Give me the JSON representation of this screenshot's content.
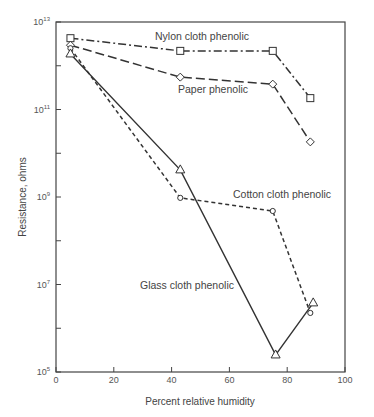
{
  "chart_data": {
    "type": "line",
    "title": "",
    "xlabel": "Percent relative humidity",
    "ylabel": "Resistance, ohms",
    "xlim": [
      0,
      100
    ],
    "ylim_log10": [
      5,
      13
    ],
    "y_scale": "log",
    "x_ticks": [
      "0",
      "20",
      "40",
      "60",
      "80",
      "100"
    ],
    "y_ticks": [
      {
        "base": "10",
        "exp": "13",
        "log": 13
      },
      {
        "base": "10",
        "exp": "11",
        "log": 11
      },
      {
        "base": "10",
        "exp": "9",
        "log": 9
      },
      {
        "base": "10",
        "exp": "7",
        "log": 7
      },
      {
        "base": "10",
        "exp": "5",
        "log": 5
      }
    ],
    "grid": false,
    "legend": "inline labels",
    "series": [
      {
        "name": "Nylon cloth phenolic",
        "marker": "square",
        "dash": "8 3 2 3",
        "x": [
          5,
          43,
          75,
          88
        ],
        "log10_y": [
          12.63,
          12.34,
          12.34,
          11.26
        ],
        "label_pos": [
          155,
          40
        ]
      },
      {
        "name": "Paper phenolic",
        "marker": "diamond",
        "dash": "9 4",
        "x": [
          5,
          43,
          75,
          88
        ],
        "log10_y": [
          12.47,
          11.74,
          11.58,
          10.26
        ],
        "label_pos": [
          178,
          93
        ]
      },
      {
        "name": "Cotton cloth phenolic",
        "marker": "circle",
        "dash": "4 3",
        "x": [
          5,
          43,
          75,
          88
        ],
        "log10_y": [
          12.4,
          8.98,
          8.68,
          6.35
        ],
        "label_pos": [
          233,
          198
        ]
      },
      {
        "name": "Glass cloth phenolic",
        "marker": "triangle",
        "dash": "",
        "x": [
          5,
          43,
          76,
          89
        ],
        "log10_y": [
          12.27,
          9.62,
          5.39,
          6.58
        ],
        "label_pos": [
          140,
          289
        ]
      }
    ]
  },
  "caption": "Fig. Effect of humidity on resistance of phenolic laminates"
}
